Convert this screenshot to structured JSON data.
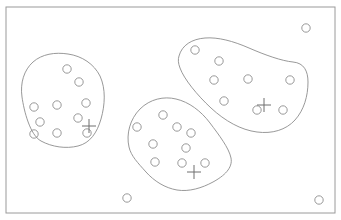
{
  "figure": {
    "title": "",
    "background_color": "#ffffff",
    "width": 341,
    "height": 220
  },
  "frame": {
    "name": "bounding-rectangle",
    "x": 6,
    "y": 7,
    "width": 329,
    "height": 206,
    "stroke_color": "#9a9a9a",
    "stroke_width": 1,
    "fill": "none"
  },
  "style": {
    "cluster_stroke_color": "#8d8d8d",
    "cluster_stroke_width": 0.9,
    "cluster_fill": "none",
    "point_stroke_color": "#8d8d8d",
    "point_stroke_width": 0.9,
    "point_fill": "none",
    "point_radius": 4.2,
    "marker_stroke_color": "#6e6e6e",
    "marker_stroke_width": 1,
    "marker_arm": 7
  },
  "chart_data": {
    "type": "scatter",
    "title": "",
    "xlabel": "",
    "ylabel": "",
    "grid": false,
    "legend": "none",
    "xlim": [
      0,
      341
    ],
    "ylim": [
      0,
      220
    ],
    "clusters": [
      {
        "id": "cluster-left",
        "label": "Left cluster",
        "point_count": 9,
        "centroid_marker": {
          "x": 89,
          "y": 126
        },
        "outline_path": "M 22 97 C 20 83 24 70 33 62 C 42 54 55 52 68 54 C 82 56 94 64 100 76 C 106 89 105 105 101 119 C 97 133 90 143 78 146 C 66 149 52 147 41 141 C 30 135 24 111 22 97 Z",
        "points": [
          {
            "x": 67,
            "y": 69
          },
          {
            "x": 79,
            "y": 82
          },
          {
            "x": 57,
            "y": 105
          },
          {
            "x": 34,
            "y": 107
          },
          {
            "x": 86,
            "y": 103
          },
          {
            "x": 40,
            "y": 122
          },
          {
            "x": 78,
            "y": 118
          },
          {
            "x": 34,
            "y": 134
          },
          {
            "x": 57,
            "y": 133
          },
          {
            "x": 87,
            "y": 133
          }
        ]
      },
      {
        "id": "cluster-middle",
        "label": "Middle cluster",
        "point_count": 10,
        "centroid_marker": {
          "x": 194,
          "y": 172
        },
        "outline_path": "M 129 147 C 126 134 130 119 140 109 C 150 99 164 96 176 99 C 189 102 201 111 210 123 C 219 135 229 148 231 158 C 233 168 224 176 213 182 C 202 188 189 192 177 190 C 165 188 154 181 146 172 C 138 163 131 156 129 147 Z",
        "points": [
          {
            "x": 163,
            "y": 115
          },
          {
            "x": 137,
            "y": 127
          },
          {
            "x": 177,
            "y": 127
          },
          {
            "x": 191,
            "y": 133
          },
          {
            "x": 153,
            "y": 144
          },
          {
            "x": 186,
            "y": 148
          },
          {
            "x": 155,
            "y": 162
          },
          {
            "x": 182,
            "y": 163
          },
          {
            "x": 205,
            "y": 163
          }
        ]
      },
      {
        "id": "cluster-right",
        "label": "Right cluster",
        "point_count": 9,
        "centroid_marker": {
          "x": 264,
          "y": 105
        },
        "outline_path": "M 179 56 C 182 45 192 39 205 38 C 218 37 233 41 249 48 C 265 55 282 61 293 62 C 304 63 308 71 308 82 C 308 96 304 110 295 120 C 286 130 272 134 257 132 C 241 130 225 121 211 108 C 197 95 184 79 180 68 C 178 63 178 59 179 56 Z",
        "points": [
          {
            "x": 195,
            "y": 50
          },
          {
            "x": 219,
            "y": 61
          },
          {
            "x": 214,
            "y": 80
          },
          {
            "x": 248,
            "y": 79
          },
          {
            "x": 290,
            "y": 80
          },
          {
            "x": 224,
            "y": 101
          },
          {
            "x": 257,
            "y": 110
          },
          {
            "x": 283,
            "y": 110
          }
        ]
      }
    ],
    "outliers": {
      "label": "Ungrouped points",
      "count": 3,
      "points": [
        {
          "x": 306,
          "y": 28,
          "name": "outlier-top-right"
        },
        {
          "x": 127,
          "y": 198,
          "name": "outlier-bottom-left"
        },
        {
          "x": 319,
          "y": 200,
          "name": "outlier-bottom-right"
        }
      ]
    }
  }
}
